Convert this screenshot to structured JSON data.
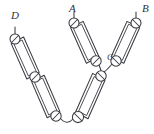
{
  "diagram": {
    "type": "hand-drawn-schematic",
    "background_color": "#ffffff",
    "stroke_color": "#3a3a42",
    "labels": [
      {
        "id": "label-d",
        "text": "D",
        "x": 11,
        "y": 16,
        "size": "normal"
      },
      {
        "id": "label-a",
        "text": "A",
        "x": 69,
        "y": 9,
        "size": "normal"
      },
      {
        "id": "label-b",
        "text": "B",
        "x": 142,
        "y": 9,
        "size": "normal"
      },
      {
        "id": "label-c",
        "text": "C",
        "x": 107,
        "y": 58,
        "size": "small"
      }
    ],
    "nodes": [
      {
        "id": "node-d-top",
        "x": 15,
        "y": 39,
        "r": 5.0
      },
      {
        "id": "node-d-mid",
        "x": 35,
        "y": 77,
        "r": 5.2
      },
      {
        "id": "node-d-bottom",
        "x": 56,
        "y": 116,
        "r": 5.2
      },
      {
        "id": "node-a-top",
        "x": 74,
        "y": 23,
        "r": 5.0
      },
      {
        "id": "node-a-bottom",
        "x": 96,
        "y": 61,
        "r": 5.2
      },
      {
        "id": "node-b-top",
        "x": 136,
        "y": 23,
        "r": 5.0
      },
      {
        "id": "node-c",
        "x": 116,
        "y": 61,
        "r": 5.2
      },
      {
        "id": "node-center",
        "x": 101,
        "y": 76,
        "r": 5.2
      },
      {
        "id": "node-v-bottom",
        "x": 78,
        "y": 117,
        "r": 5.6
      }
    ],
    "components": [
      {
        "id": "component-d-upper",
        "label": "resistor",
        "x1": 18,
        "y1": 45,
        "x2": 32,
        "y2": 71
      },
      {
        "id": "component-d-lower",
        "label": "resistor",
        "x1": 38,
        "y1": 83,
        "x2": 53,
        "y2": 110
      },
      {
        "id": "component-a-upper",
        "label": "resistor",
        "x1": 77,
        "y1": 29,
        "x2": 93,
        "y2": 55
      },
      {
        "id": "component-b-upper",
        "label": "resistor",
        "x1": 133,
        "y1": 29,
        "x2": 118,
        "y2": 55
      },
      {
        "id": "component-center-lower",
        "label": "resistor",
        "x1": 98,
        "y1": 82,
        "x2": 82,
        "y2": 110
      }
    ],
    "wires": [
      {
        "id": "wire-d-terminal",
        "path": "M 15 27 L 15 34"
      },
      {
        "id": "wire-a-terminal",
        "path": "M 74 12 L 74 18"
      },
      {
        "id": "wire-b-terminal",
        "path": "M 136 12 L 136 18"
      },
      {
        "id": "wire-c-to-center",
        "path": "M 112 64 Q 107 70 104 72"
      },
      {
        "id": "wire-a-to-center",
        "path": "M 99 65 Q 101 70 101 71"
      },
      {
        "id": "wire-bottom-arc",
        "path": "M 60 118 Q 67 126 73 119"
      }
    ]
  }
}
